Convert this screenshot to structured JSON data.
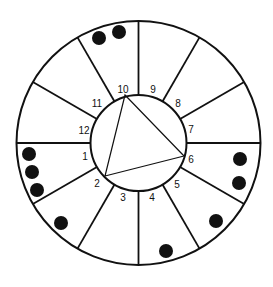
{
  "diagram": {
    "type": "circular-wheel",
    "center": [
      138.5,
      143
    ],
    "outer_radius": 122,
    "inner_radius": 48,
    "sectors": 12,
    "colors": {
      "stroke": "#111111",
      "dot": "#111111",
      "background": "#ffffff"
    },
    "labels": [
      {
        "text": "1",
        "x": 85,
        "y": 160
      },
      {
        "text": "2",
        "x": 97,
        "y": 187
      },
      {
        "text": "3",
        "x": 123,
        "y": 201
      },
      {
        "text": "4",
        "x": 152,
        "y": 201
      },
      {
        "text": "5",
        "x": 177,
        "y": 188
      },
      {
        "text": "6",
        "x": 191,
        "y": 163
      },
      {
        "text": "7",
        "x": 191,
        "y": 133
      },
      {
        "text": "8",
        "x": 178,
        "y": 107
      },
      {
        "text": "9",
        "x": 153,
        "y": 93
      },
      {
        "text": "10",
        "x": 123,
        "y": 93
      },
      {
        "text": "11",
        "x": 97,
        "y": 107
      },
      {
        "text": "12",
        "x": 84,
        "y": 134
      }
    ],
    "triangle": {
      "vertices": [
        "10",
        "6",
        "2"
      ],
      "points": [
        [
          125,
          95
        ],
        [
          184,
          156
        ],
        [
          105,
          176
        ]
      ]
    },
    "dots": [
      {
        "x": 99,
        "y": 38
      },
      {
        "x": 119,
        "y": 32
      },
      {
        "x": 29,
        "y": 154
      },
      {
        "x": 32,
        "y": 172
      },
      {
        "x": 37,
        "y": 190
      },
      {
        "x": 61,
        "y": 223
      },
      {
        "x": 166,
        "y": 251
      },
      {
        "x": 216,
        "y": 221
      },
      {
        "x": 240,
        "y": 159
      },
      {
        "x": 239,
        "y": 183
      }
    ]
  }
}
